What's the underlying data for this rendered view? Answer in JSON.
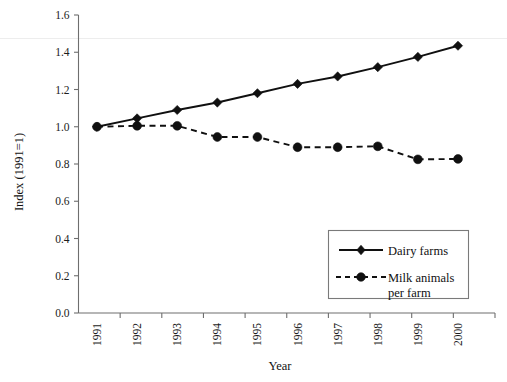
{
  "chart_data": {
    "type": "line",
    "title": "",
    "xlabel": "Year",
    "ylabel": "Index (1991=1)",
    "categories": [
      "1991",
      "1992",
      "1993",
      "1994",
      "1995",
      "1996",
      "1997",
      "1998",
      "1999",
      "2000"
    ],
    "x": [
      1991,
      1992,
      1993,
      1994,
      1995,
      1996,
      1997,
      1998,
      1999,
      2000
    ],
    "series": [
      {
        "name": "Dairy farms",
        "marker": "diamond",
        "linestyle": "solid",
        "color": "#101010",
        "values": [
          1.0,
          1.045,
          1.09,
          1.13,
          1.18,
          1.23,
          1.27,
          1.32,
          1.375,
          1.435
        ]
      },
      {
        "name": "Milk animals per farm",
        "marker": "circle",
        "linestyle": "dashed",
        "color": "#101010",
        "values": [
          1.0,
          1.005,
          1.005,
          0.945,
          0.945,
          0.89,
          0.89,
          0.895,
          0.825,
          0.827
        ]
      }
    ],
    "ylim": [
      0.0,
      1.6
    ],
    "ytick_labels": [
      "0.0",
      "0.2",
      "0.4",
      "0.6",
      "0.8",
      "1.0",
      "1.2",
      "1.4",
      "1.6"
    ],
    "ytick_values": [
      0.0,
      0.2,
      0.4,
      0.6,
      0.8,
      1.0,
      1.2,
      1.4,
      1.6
    ],
    "grid": false,
    "legend_position": "lower-right",
    "legend_entries": [
      "Dairy farms",
      "Milk animals per farm"
    ]
  },
  "legend": {
    "entry_1_label": "Dairy farms",
    "entry_2_line_1": "Milk animals",
    "entry_2_line_2": "per farm"
  },
  "axes": {
    "x_title": "Year",
    "y_title": "Index (1991=1)"
  }
}
